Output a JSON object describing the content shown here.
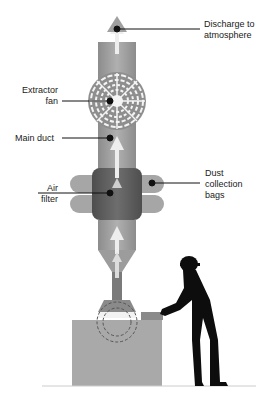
{
  "diagram": {
    "labels": {
      "discharge_line1": "Discharge to",
      "discharge_line2": "atmosphere",
      "extractor_line1": "Extractor",
      "extractor_line2": "fan",
      "main_duct": "Main duct",
      "air_line1": "Air",
      "air_line2": "filter",
      "dust_line1": "Dust",
      "dust_line2": "collection",
      "dust_line3": "bags"
    },
    "colors": {
      "duct": "#9a9a9a",
      "duct_light": "#b5b5b5",
      "filter": "#5e5e5e",
      "bags": "#a3a3a3",
      "arrow": "#efefef",
      "bench": "#a8a8a8",
      "worker": "#0d0d0d",
      "leader": "#111111"
    }
  }
}
